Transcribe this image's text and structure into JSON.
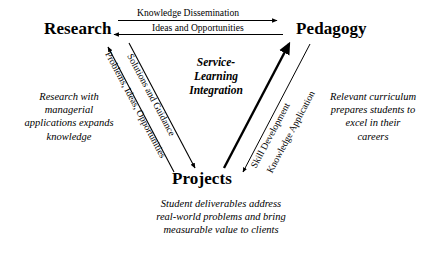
{
  "diagram": {
    "center_label": "Service-\nLearning\nIntegration",
    "background_color": "#ffffff",
    "line_color": "#000000",
    "nodes": [
      {
        "id": "research",
        "label": "Research"
      },
      {
        "id": "pedagogy",
        "label": "Pedagogy"
      },
      {
        "id": "projects",
        "label": "Projects"
      }
    ],
    "edges": [
      {
        "id": "knowledge-dissemination",
        "label": "Knowledge Dissemination",
        "from": "Research",
        "to": "Pedagogy",
        "direction": "right",
        "weight": "thin"
      },
      {
        "id": "ideas-opportunities",
        "label": "Ideas and Opportunities",
        "from": "Pedagogy",
        "to": "Research",
        "direction": "left",
        "weight": "thin"
      },
      {
        "id": "problems-ideas-opportunities",
        "label": "Problems, Ideas, Opportunities",
        "from": "Projects",
        "to": "Research",
        "direction": "up-left",
        "weight": "thin"
      },
      {
        "id": "solutions-guidance",
        "label": "Solutions and Guidance",
        "from": "Research",
        "to": "Projects",
        "direction": "down-right",
        "weight": "thin"
      },
      {
        "id": "skill-development",
        "label": "Skill Development",
        "from": "Projects",
        "to": "Pedagogy",
        "direction": "up-right",
        "weight": "thick"
      },
      {
        "id": "knowledge-application",
        "label": "Knowledge Application",
        "from": "Pedagogy",
        "to": "Projects",
        "direction": "down-left",
        "weight": "thin"
      }
    ],
    "captions": {
      "left": "Research with\nmanagerial\napplications expands\nknowledge",
      "right": "Relevant curriculum\nprepares students to\nexcel in their\ncareers",
      "bottom": "Student deliverables address\nreal-world problems and bring\nmeasurable value to clients"
    }
  }
}
